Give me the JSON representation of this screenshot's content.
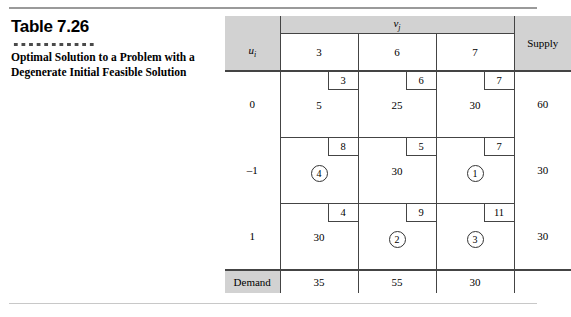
{
  "figure": {
    "number_label": "Table 7.26",
    "caption": "Optimal Solution to a Problem with a Degenerate Initial Feasible Solution"
  },
  "tableau": {
    "vj_header": "v",
    "vj_subscript": "j",
    "ui_header": "u",
    "ui_subscript": "i",
    "supply_header": "Supply",
    "demand_header": "Demand",
    "v_values": [
      "3",
      "6",
      "7"
    ],
    "u_values": [
      "0",
      "–1",
      "1"
    ],
    "supply_values": [
      "60",
      "30",
      "30"
    ],
    "demand_values": [
      "35",
      "55",
      "30"
    ],
    "rows": [
      {
        "u": "0",
        "supply": "60",
        "cells": [
          {
            "cost": "3",
            "allocation": "5",
            "circled": false
          },
          {
            "cost": "6",
            "allocation": "25",
            "circled": false
          },
          {
            "cost": "7",
            "allocation": "30",
            "circled": false
          }
        ]
      },
      {
        "u": "–1",
        "supply": "30",
        "cells": [
          {
            "cost": "8",
            "allocation": "4",
            "circled": true
          },
          {
            "cost": "5",
            "allocation": "30",
            "circled": false
          },
          {
            "cost": "7",
            "allocation": "1",
            "circled": true
          }
        ]
      },
      {
        "u": "1",
        "supply": "30",
        "cells": [
          {
            "cost": "4",
            "allocation": "30",
            "circled": false
          },
          {
            "cost": "9",
            "allocation": "2",
            "circled": true
          },
          {
            "cost": "11",
            "allocation": "3",
            "circled": true
          }
        ]
      }
    ]
  }
}
